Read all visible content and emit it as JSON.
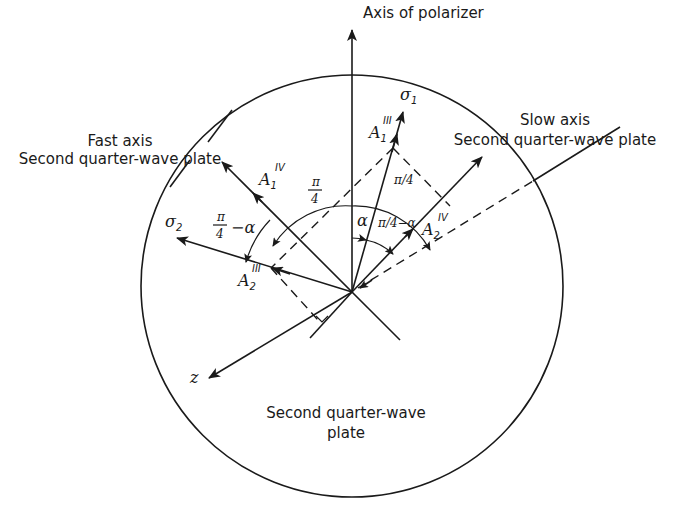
{
  "labels": {
    "polarizer_axis": "Axis of polarizer",
    "fast_axis_line1": "Fast axis",
    "fast_axis_line2": "Second quarter-wave plate",
    "slow_axis_line1": "Slow axis",
    "slow_axis_line2": "Second quarter-wave plate",
    "plate_line1": "Second quarter-wave",
    "plate_line2": "plate",
    "sigma1": "σ",
    "sigma1_sub": "1",
    "sigma2": "σ",
    "sigma2_sub": "2",
    "z": "z",
    "A1III": "A",
    "A1III_sub": "1",
    "A1III_sup": "III",
    "A1IV": "A",
    "A1IV_sub": "1",
    "A1IV_sup": "IV",
    "A2III": "A",
    "A2III_sub": "2",
    "A2III_sup": "III",
    "A2IV": "A",
    "A2IV_sub": "2",
    "A2IV_sup": "IV",
    "angle_pi4_top_num": "π",
    "angle_pi4_top_den": "4",
    "angle_pi4_slash": "π/4",
    "angle_alpha": "α",
    "angle_pi4_minus_alpha_right": "π/4−α",
    "angle_pi4_minus_alpha_left_num": "π",
    "angle_pi4_minus_alpha_left_den": "4",
    "angle_pi4_minus_alpha_left_tail": "−α"
  },
  "colors": {
    "ink": "#1a1a1a",
    "background": "#ffffff"
  }
}
